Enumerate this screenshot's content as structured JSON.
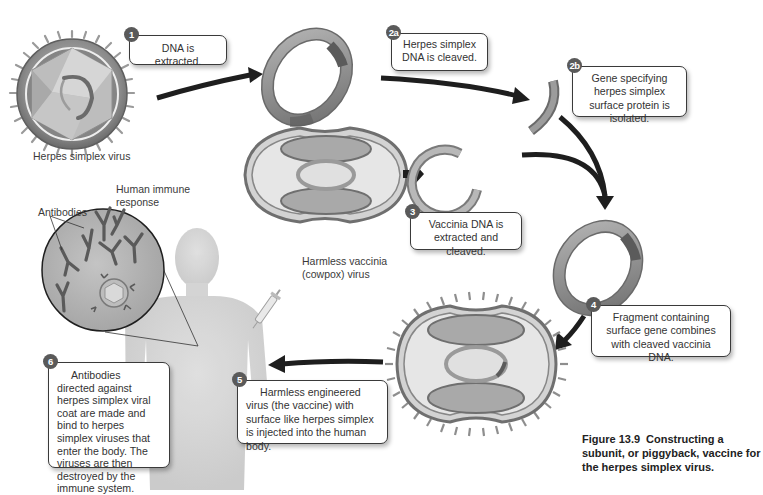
{
  "diagram": {
    "title": "Constructing a subunit, or piggyback, vaccine for the herpes simplex virus",
    "caption": {
      "figure_number": "Figure 13.9",
      "text": "Constructing a subunit, or piggyback, vaccine for the herpes simplex virus."
    },
    "labels": {
      "herpes_virus": "Herpes simplex virus",
      "vaccinia_line1": "Harmless vaccinia",
      "vaccinia_line2": "(cowpox) virus",
      "immune_line1": "Human immune",
      "immune_line2": "response",
      "antibodies": "Antibodies"
    },
    "steps": [
      {
        "id": "1",
        "badge": "1",
        "text": "DNA is extracted."
      },
      {
        "id": "2a",
        "badge": "2a",
        "text": "Herpes simplex DNA is cleaved."
      },
      {
        "id": "2b",
        "badge": "2b",
        "text": "Gene specifying herpes simplex surface protein is isolated."
      },
      {
        "id": "3",
        "badge": "3",
        "text": "Vaccinia DNA is extracted and cleaved."
      },
      {
        "id": "4",
        "badge": "4",
        "text": "Fragment containing surface gene combines with cleaved vaccinia DNA."
      },
      {
        "id": "5",
        "badge": "5",
        "text": "Harmless engineered virus (the vaccine) with surface like herpes simplex is injected into the human body."
      },
      {
        "id": "6",
        "badge": "6",
        "text": "Antibodies directed against herpes simplex viral coat are made and bind to herpes simplex viruses that enter the body. The viruses are then destroyed by the immune system."
      }
    ],
    "colors": {
      "arrow": "#1e1e1e",
      "badge": "#5a5a5a",
      "callout_border": "#3a3a3a",
      "ring": "#8c8c8c",
      "capsule_fill": "#dcdcdc",
      "capsule_lobe": "#a9a9a9"
    }
  }
}
